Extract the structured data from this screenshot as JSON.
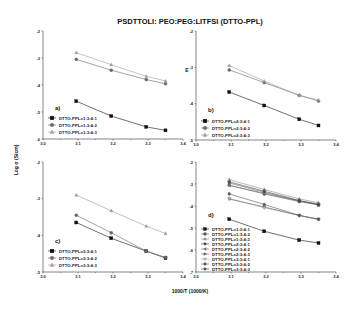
{
  "title": "PSDTTOLI: PEO:PEG:LITFSI (DTTO-PPL)",
  "xlabel": "1000/T (1000/K)",
  "ylabel": "Log σ (S/cm)",
  "chart_data": [
    {
      "type": "line",
      "panel": "a)",
      "title": "PSDTTOLI: PEO:PEG:LITFSI (DTTO-PPL)",
      "xlabel": "1000/T (1000/K)",
      "ylabel": "Log σ (S/cm)",
      "xlim": [
        3.0,
        3.4
      ],
      "ylim": [
        -6,
        -2
      ],
      "xticks": [
        "3.0",
        "3.1",
        "3.2",
        "3.3",
        "3.4"
      ],
      "yticks": [
        "-2",
        "-3",
        "-4",
        "-5",
        "-6"
      ],
      "x": [
        3.095,
        3.195,
        3.295,
        3.35
      ],
      "legend_position": "lower left",
      "series": [
        {
          "name": "DTTO-PPL=1:3:4:1",
          "marker": "square",
          "color": "#111111",
          "values": [
            -4.6,
            -5.15,
            -5.55,
            -5.68
          ]
        },
        {
          "name": "DTTO-PPL=1:3:4:2",
          "marker": "circle",
          "color": "#666666",
          "values": [
            -3.05,
            -3.45,
            -3.8,
            -3.95
          ]
        },
        {
          "name": "DTTO-PPL=1:3:4:3",
          "marker": "triangle",
          "color": "#999999",
          "values": [
            -2.8,
            -3.25,
            -3.68,
            -3.85
          ]
        }
      ]
    },
    {
      "type": "line",
      "panel": "b)",
      "xlim": [
        3.0,
        3.4
      ],
      "ylim": [
        -5,
        -2
      ],
      "xticks": [
        "3.0",
        "3.1",
        "3.2",
        "3.3",
        "3.4"
      ],
      "yticks": [
        "-2",
        "-3",
        "-4",
        "-5"
      ],
      "x": [
        3.095,
        3.195,
        3.295,
        3.35
      ],
      "legend_position": "lower left",
      "series": [
        {
          "name": "DTTO-PPL=2:3:4:1",
          "marker": "square",
          "color": "#111111",
          "values": [
            -3.68,
            -4.05,
            -4.43,
            -4.6
          ]
        },
        {
          "name": "DTTO-PPL=2:3:4:2",
          "marker": "circle",
          "color": "#666666",
          "values": [
            -3.07,
            -3.42,
            -3.77,
            -3.93
          ]
        },
        {
          "name": "DTTO-PPL=2:3:4:3",
          "marker": "triangle",
          "color": "#999999",
          "values": [
            -2.95,
            -3.38,
            -3.77,
            -3.9
          ]
        }
      ]
    },
    {
      "type": "line",
      "panel": "c)",
      "xlim": [
        3.0,
        3.4
      ],
      "ylim": [
        -5,
        -2
      ],
      "xticks": [
        "3.0",
        "3.1",
        "3.2",
        "3.3",
        "3.4"
      ],
      "yticks": [
        "-2",
        "-3",
        "-4",
        "-5"
      ],
      "x": [
        3.095,
        3.195,
        3.295,
        3.35
      ],
      "legend_position": "lower left",
      "series": [
        {
          "name": "DTTO-PPL=3:3:4:1",
          "marker": "square",
          "color": "#111111",
          "values": [
            -3.65,
            -4.08,
            -4.43,
            -4.62
          ]
        },
        {
          "name": "DTTO-PPL=3:3:4:2",
          "marker": "circle",
          "color": "#666666",
          "values": [
            -3.45,
            -3.93,
            -4.43,
            -4.6
          ]
        },
        {
          "name": "DTTO-PPL=3:3:4:3",
          "marker": "triangle",
          "color": "#999999",
          "values": [
            -2.9,
            -3.33,
            -3.75,
            -3.95
          ]
        }
      ]
    },
    {
      "type": "line",
      "panel": "d)",
      "xlim": [
        3.0,
        3.4
      ],
      "ylim": [
        -7,
        -2
      ],
      "xticks": [
        "3.0",
        "3.1",
        "3.2",
        "3.3",
        "3.4"
      ],
      "yticks": [
        "-2",
        "-3",
        "-4",
        "-5",
        "-6",
        "-7"
      ],
      "x": [
        3.095,
        3.195,
        3.295,
        3.35
      ],
      "legend_position": "lower left",
      "series": [
        {
          "name": "DTTO-PPL=1:3:4:1",
          "marker": "square",
          "color": "#111111",
          "values": [
            -4.6,
            -5.15,
            -5.55,
            -5.68
          ]
        },
        {
          "name": "DTTO-PPL=1:3:4:2",
          "marker": "circle",
          "color": "#555555",
          "values": [
            -3.05,
            -3.45,
            -3.8,
            -3.95
          ]
        },
        {
          "name": "DTTO-PPL=1:3:4:3",
          "marker": "triangle",
          "color": "#888888",
          "values": [
            -2.8,
            -3.25,
            -3.68,
            -3.85
          ]
        },
        {
          "name": "DTTO-PPL=2:3:4:1",
          "marker": "triangle-down",
          "color": "#333333",
          "values": [
            -3.68,
            -4.05,
            -4.43,
            -4.6
          ]
        },
        {
          "name": "DTTO-PPL=2:3:4:2",
          "marker": "triangle-left",
          "color": "#777777",
          "values": [
            -3.07,
            -3.42,
            -3.77,
            -3.93
          ]
        },
        {
          "name": "DTTO-PPL=2:3:4:3",
          "marker": "triangle-right",
          "color": "#666666",
          "values": [
            -2.95,
            -3.38,
            -3.77,
            -3.9
          ]
        },
        {
          "name": "DTTO-PPL=3:3:4:1",
          "marker": "diamond",
          "color": "#aaaaaa",
          "values": [
            -3.65,
            -4.08,
            -4.43,
            -4.62
          ]
        },
        {
          "name": "DTTO-PPL=3:3:4:2",
          "marker": "hexagon",
          "color": "#555555",
          "values": [
            -3.45,
            -3.93,
            -4.43,
            -4.6
          ]
        },
        {
          "name": "DTTO-PPL=3:3:4:3",
          "marker": "star",
          "color": "#444444",
          "values": [
            -2.9,
            -3.33,
            -3.75,
            -3.95
          ]
        }
      ]
    }
  ],
  "layout": {
    "panels": [
      {
        "left": 43,
        "right": 183,
        "top": 31,
        "bottom": 139,
        "tag_x": 55,
        "tag_y": 110,
        "legend_x": 48,
        "legend_y": 118
      },
      {
        "left": 196,
        "right": 336,
        "top": 31,
        "bottom": 140,
        "tag_x": 208,
        "tag_y": 112,
        "legend_x": 201,
        "legend_y": 121
      },
      {
        "left": 43,
        "right": 183,
        "top": 162,
        "bottom": 272,
        "tag_x": 55,
        "tag_y": 243,
        "legend_x": 48,
        "legend_y": 251
      },
      {
        "left": 196,
        "right": 336,
        "top": 162,
        "bottom": 272,
        "tag_x": 208,
        "tag_y": 217,
        "legend_x": 201,
        "legend_y": 229
      }
    ]
  }
}
